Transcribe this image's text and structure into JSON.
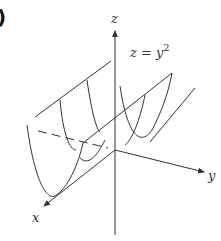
{
  "figure": {
    "panel_marker": ")",
    "equation": "z = y",
    "equation_exponent": "2",
    "axes": {
      "x": "x",
      "y": "y",
      "z": "z"
    },
    "surface": "parabolic cylinder"
  }
}
